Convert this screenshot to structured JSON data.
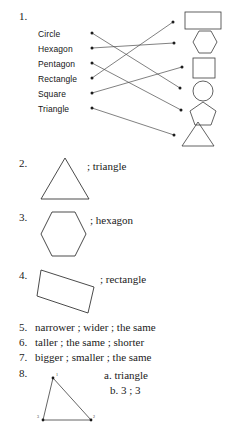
{
  "document": {
    "kind": "math-worksheet-answer-key",
    "background_color": "#ffffff",
    "ink_color": "#1a1a1a"
  },
  "item1": {
    "number": "1.",
    "left_labels": [
      {
        "text": "Circle",
        "connects_to": "circle"
      },
      {
        "text": "Hexagon",
        "connects_to": "hexagon"
      },
      {
        "text": "Pentagon",
        "connects_to": "pentagon"
      },
      {
        "text": "Rectangle",
        "connects_to": "rectangle"
      },
      {
        "text": "Square",
        "connects_to": "square"
      },
      {
        "text": "Triangle",
        "connects_to": "triangle"
      }
    ],
    "right_shapes": [
      {
        "name": "rectangle"
      },
      {
        "name": "hexagon"
      },
      {
        "name": "square"
      },
      {
        "name": "circle"
      },
      {
        "name": "pentagon"
      },
      {
        "name": "triangle"
      }
    ]
  },
  "item2": {
    "number": "2.",
    "shape": "triangle",
    "caption": "; triangle"
  },
  "item3": {
    "number": "3.",
    "shape": "hexagon",
    "caption": "; hexagon"
  },
  "item4": {
    "number": "4.",
    "shape": "rectangle",
    "caption": "; rectangle"
  },
  "item5": {
    "number": "5.",
    "text": "narrower ; wider ; the same"
  },
  "item6": {
    "number": "6.",
    "text": "taller ; the same ; shorter"
  },
  "item7": {
    "number": "7.",
    "text": "bigger ; smaller ; the same"
  },
  "item8": {
    "number": "8.",
    "answer_a": "a.  triangle",
    "answer_b": "b.  3 ; 3",
    "vertex_labels": [
      "1",
      "2",
      "3"
    ]
  }
}
